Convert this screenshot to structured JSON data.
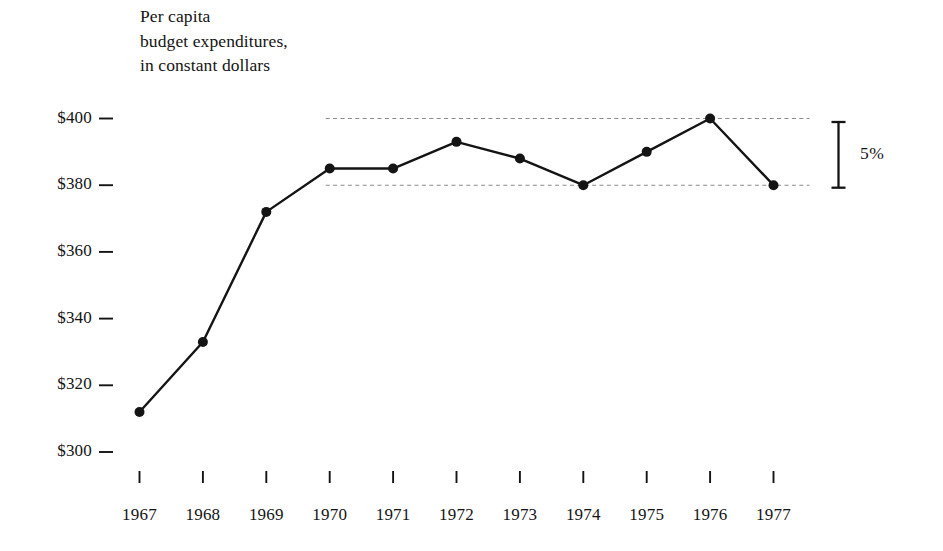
{
  "figure": {
    "caption": "Per capita\nbudget expenditures,\nin constant dollars",
    "caption_line_1": "Per capita",
    "caption_line_2": "budget expenditures,",
    "caption_line_3": "in constant dollars",
    "background_color": "#ffffff",
    "ink_color": "#141414",
    "reference_line_color": "#8a8a8a"
  },
  "annotation": {
    "range_label": "5%",
    "range_top_value": 400,
    "range_bottom_value": 380
  },
  "chart_data": {
    "type": "line",
    "title": "Per capita budget expenditures, in constant dollars",
    "subtitle": "",
    "xlabel": "",
    "ylabel": "",
    "x": [
      1967,
      1968,
      1969,
      1970,
      1971,
      1972,
      1973,
      1974,
      1975,
      1976,
      1977
    ],
    "categories": [
      "1967",
      "1968",
      "1969",
      "1970",
      "1971",
      "1972",
      "1973",
      "1974",
      "1975",
      "1976",
      "1977"
    ],
    "values": [
      312,
      333,
      372,
      385,
      385,
      393,
      388,
      380,
      390,
      400,
      380
    ],
    "series": [
      {
        "name": "Per capita budget expenditures",
        "values": [
          312,
          333,
          372,
          385,
          385,
          393,
          388,
          380,
          390,
          400,
          380
        ]
      }
    ],
    "ylim": [
      300,
      400
    ],
    "xlim": [
      1967,
      1977
    ],
    "ytick_values": [
      400,
      380,
      360,
      340,
      320,
      300
    ],
    "ytick_labels": [
      "$400",
      "$380",
      "$360",
      "$340",
      "$320",
      "$300"
    ],
    "xtick_labels": [
      "1967",
      "1968",
      "1969",
      "1970",
      "1971",
      "1972",
      "1973",
      "1974",
      "1975",
      "1976",
      "1977"
    ],
    "grid": false,
    "legend": false,
    "legend_position": "none",
    "markers": "filled-circle",
    "reference_lines": [
      {
        "value": 400,
        "style": "dashed",
        "from_x": 1970,
        "to_x": 1977
      },
      {
        "value": 380,
        "style": "dashed",
        "from_x": 1970,
        "to_x": 1977
      }
    ],
    "annotations": [
      {
        "text": "5%",
        "type": "range-bracket",
        "from_value": 380,
        "to_value": 400
      }
    ]
  }
}
